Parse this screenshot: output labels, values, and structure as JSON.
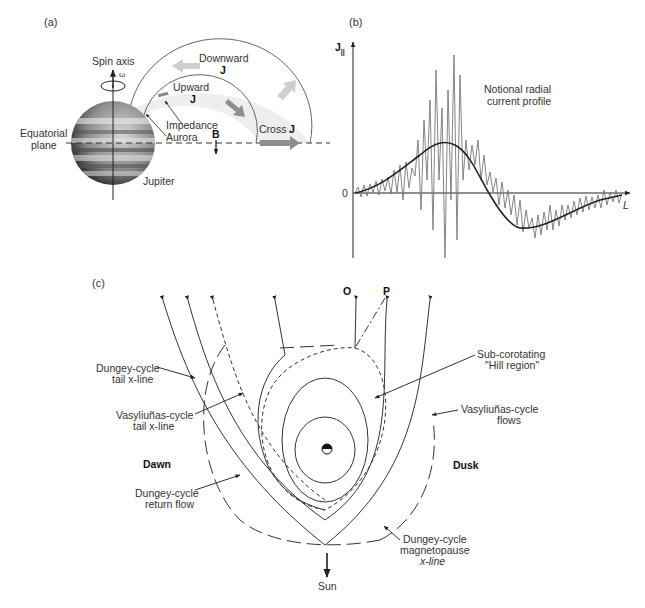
{
  "panels": {
    "a": {
      "label": "(a)",
      "spin_axis": "Spin axis",
      "omega": "ω",
      "downward": "Downward",
      "downward_j": "J",
      "upward": "Upward",
      "upward_j": "J",
      "impedance": "Impedance",
      "aurora": "Aurora",
      "equatorial": "Equatorial",
      "plane": "plane",
      "b_field": "B",
      "cross": "Cross",
      "cross_j": "J",
      "jupiter": "Jupiter"
    },
    "b": {
      "label": "(b)",
      "y_axis": "J",
      "y_sub": "||",
      "x_axis": "L",
      "zero": "0",
      "title_line1": "Notional radial",
      "title_line2": "current profile"
    },
    "c": {
      "label": "(c)",
      "o": "O",
      "p": "P",
      "dungey_tail_1": "Dungey-cycle",
      "dungey_tail_2": "tail x-line",
      "vas_tail_1": "Vasyliuñas-cycle",
      "vas_tail_2": "tail x-line",
      "dawn": "Dawn",
      "dusk": "Dusk",
      "dungey_return_1": "Dungey-cycle",
      "dungey_return_2": "return flow",
      "subcorot_1": "Sub-corotating",
      "subcorot_2": "\"Hill region\"",
      "vas_flows_1": "Vasyliuñas-cycle",
      "vas_flows_2": "flows",
      "dungey_mp_1": "Dungey-cycle",
      "dungey_mp_2": "magnetopause",
      "dungey_mp_3": "x-line",
      "sun": "Sun"
    }
  },
  "colors": {
    "ink": "#222222",
    "arrow_dark": "#8a8a8a",
    "arrow_light": "#c8c8c8",
    "band": "#ececec"
  }
}
